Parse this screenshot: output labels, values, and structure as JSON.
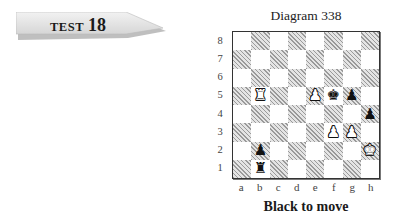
{
  "banner": {
    "word": "TEST",
    "number": "18"
  },
  "diagram": {
    "title": "Diagram 338",
    "caption": "Black to move",
    "ranks": [
      "8",
      "7",
      "6",
      "5",
      "4",
      "3",
      "2",
      "1"
    ],
    "files": [
      "a",
      "b",
      "c",
      "d",
      "e",
      "f",
      "g",
      "h"
    ],
    "pieces": [
      {
        "square": "b5",
        "color": "white",
        "type": "rook",
        "glyph": "♖"
      },
      {
        "square": "e5",
        "color": "white",
        "type": "pawn",
        "glyph": "♙"
      },
      {
        "square": "f5",
        "color": "black",
        "type": "king",
        "glyph": "♚"
      },
      {
        "square": "g5",
        "color": "black",
        "type": "pawn",
        "glyph": "♟"
      },
      {
        "square": "h4",
        "color": "black",
        "type": "pawn",
        "glyph": "♟"
      },
      {
        "square": "f3",
        "color": "white",
        "type": "pawn",
        "glyph": "♙"
      },
      {
        "square": "g3",
        "color": "white",
        "type": "pawn",
        "glyph": "♙"
      },
      {
        "square": "h2",
        "color": "white",
        "type": "king",
        "glyph": "♔"
      },
      {
        "square": "b2",
        "color": "black",
        "type": "pawn",
        "glyph": "♟"
      },
      {
        "square": "b1",
        "color": "black",
        "type": "rook",
        "glyph": "♜"
      }
    ]
  }
}
